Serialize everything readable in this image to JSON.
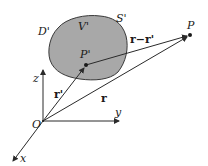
{
  "diagram": {
    "colors": {
      "region_fill": "#a8a8a8",
      "region_stroke": "#3a3a3a",
      "line": "#2a2a2a",
      "text": "#1a1a1a",
      "background": "#ffffff"
    },
    "region": {
      "outer_label": "D'",
      "volume_label": "V'",
      "surface_label": "S'"
    },
    "points": {
      "source_point": "P'",
      "field_point": "P",
      "origin": "O"
    },
    "axes": {
      "x": "x",
      "y": "y",
      "z": "z"
    },
    "vectors": {
      "source_vector": "r'",
      "field_vector": "r",
      "difference_vector": "r−r'"
    }
  }
}
